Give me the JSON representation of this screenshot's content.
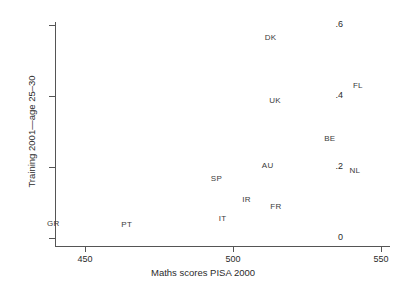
{
  "chart_data": {
    "type": "scatter",
    "title": "",
    "xlabel": "Maths scores PISA 2000",
    "ylabel": "Training 2001—age 25–30",
    "xlim": [
      438,
      552
    ],
    "ylim": [
      0,
      0.615
    ],
    "xticks": [
      450,
      500,
      550
    ],
    "xtick_labels": [
      "450",
      "500",
      "550"
    ],
    "yticks": [
      0,
      0.2,
      0.4,
      0.6
    ],
    "ytick_labels": [
      "0",
      ".2",
      ".4",
      ".6"
    ],
    "grid": false,
    "legend": "none",
    "marker_style": "text-label-only",
    "points": [
      {
        "label": "DK",
        "x": 512.7,
        "y": 0.563
      },
      {
        "label": "FL",
        "x": 542.2,
        "y": 0.428
      },
      {
        "label": "UK",
        "x": 514.2,
        "y": 0.386
      },
      {
        "label": "BE",
        "x": 532.7,
        "y": 0.279
      },
      {
        "label": "AU",
        "x": 511.7,
        "y": 0.203
      },
      {
        "label": "NL",
        "x": 541.2,
        "y": 0.189
      },
      {
        "label": "SP",
        "x": 494.4,
        "y": 0.166
      },
      {
        "label": "IR",
        "x": 504.6,
        "y": 0.107
      },
      {
        "label": "FR",
        "x": 514.5,
        "y": 0.088
      },
      {
        "label": "IT",
        "x": 496.5,
        "y": 0.054
      },
      {
        "label": "PT",
        "x": 464.1,
        "y": 0.037
      },
      {
        "label": "GR",
        "x": 439.3,
        "y": 0.04
      }
    ]
  }
}
